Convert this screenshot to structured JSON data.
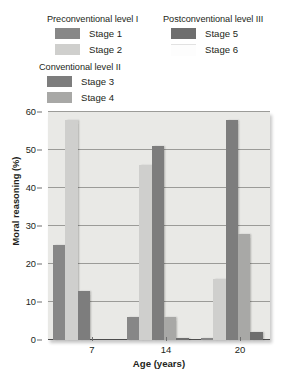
{
  "legend": {
    "groups": [
      {
        "title": "Preconventional level I",
        "items": [
          {
            "label": "Stage 1",
            "color": "#878787"
          },
          {
            "label": "Stage 2",
            "color": "#cfcfcd"
          }
        ]
      },
      {
        "title": "Conventional level II",
        "items": [
          {
            "label": "Stage 3",
            "color": "#7d7d7d"
          },
          {
            "label": "Stage 4",
            "color": "#a8a8a6"
          }
        ]
      },
      {
        "title": "Postconventional level III",
        "items": [
          {
            "label": "Stage 5",
            "color": "#6e6e6e"
          },
          {
            "label": "Stage 6",
            "color": "#fdfdfd"
          }
        ]
      }
    ]
  },
  "chart_data": {
    "type": "bar",
    "title": "",
    "xlabel": "Age (years)",
    "ylabel": "Moral reasoning (%)",
    "categories": [
      "7",
      "14",
      "20"
    ],
    "ylim": [
      0,
      60
    ],
    "yticks": [
      0,
      10,
      20,
      30,
      40,
      50,
      60
    ],
    "grid": true,
    "legend_position": "above-plot",
    "series": [
      {
        "name": "Stage 1",
        "color": "#878787",
        "values": [
          25,
          6,
          0.5
        ]
      },
      {
        "name": "Stage 2",
        "color": "#cfcfcd",
        "values": [
          58,
          46,
          16
        ]
      },
      {
        "name": "Stage 3",
        "color": "#7d7d7d",
        "values": [
          13,
          51,
          58
        ]
      },
      {
        "name": "Stage 4",
        "color": "#a8a8a6",
        "values": [
          0,
          6,
          28
        ]
      },
      {
        "name": "Stage 5",
        "color": "#6e6e6e",
        "values": [
          0,
          0.5,
          2
        ]
      },
      {
        "name": "Stage 6",
        "color": "#fdfdfd",
        "values": [
          0,
          0,
          0
        ]
      }
    ]
  }
}
